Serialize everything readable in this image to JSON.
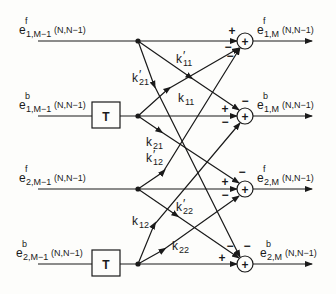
{
  "diagram": {
    "type": "two-channel lattice filter stage (signal flow graph)",
    "inputs": [
      {
        "id": "in_f1",
        "base": "e",
        "sup": "f",
        "sub": "1,M−1",
        "arg": "(N,N−1)"
      },
      {
        "id": "in_b1",
        "base": "e",
        "sup": "b",
        "sub": "1,M−1",
        "arg": "(N,N−1)"
      },
      {
        "id": "in_f2",
        "base": "e",
        "sup": "f",
        "sub": "2,M−1",
        "arg": "(N,N−1)"
      },
      {
        "id": "in_b2",
        "base": "e",
        "sup": "b",
        "sub": "2,M−1",
        "arg": "(N,N−1)"
      }
    ],
    "outputs": [
      {
        "id": "out_f1",
        "base": "e",
        "sup": "f",
        "sub": "1,M",
        "arg": "(N,N−1)"
      },
      {
        "id": "out_b1",
        "base": "e",
        "sup": "b",
        "sub": "1,M",
        "arg": "(N,N−1)"
      },
      {
        "id": "out_f2",
        "base": "e",
        "sup": "f",
        "sub": "2,M",
        "arg": "(N,N−1)"
      },
      {
        "id": "out_b2",
        "base": "e",
        "sup": "b",
        "sub": "2,M",
        "arg": "(N,N−1)"
      }
    ],
    "delays": [
      {
        "id": "delay1",
        "label": "T"
      },
      {
        "id": "delay2",
        "label": "T"
      }
    ],
    "summers": [
      {
        "id": "sum1",
        "symbol": "+",
        "signs": [
          "+",
          "−",
          "−"
        ]
      },
      {
        "id": "sum2",
        "symbol": "+",
        "signs": [
          "−",
          "+",
          "−"
        ]
      },
      {
        "id": "sum3",
        "symbol": "+",
        "signs": [
          "−",
          "+",
          "−"
        ]
      },
      {
        "id": "sum4",
        "symbol": "+",
        "signs": [
          "−",
          "−",
          "+"
        ]
      }
    ],
    "coefficients": [
      {
        "id": "k11p",
        "base": "k",
        "prime": "′",
        "sub": "11"
      },
      {
        "id": "k21p",
        "base": "k",
        "prime": "′",
        "sub": "21"
      },
      {
        "id": "k11",
        "base": "k",
        "prime": "",
        "sub": "11"
      },
      {
        "id": "k21",
        "base": "k",
        "prime": "",
        "sub": "21"
      },
      {
        "id": "k12p",
        "base": "k",
        "prime": "′",
        "sub": "12"
      },
      {
        "id": "k12",
        "base": "k",
        "prime": "",
        "sub": "12"
      },
      {
        "id": "k22p",
        "base": "k",
        "prime": "′",
        "sub": "22"
      },
      {
        "id": "k22",
        "base": "k",
        "prime": "",
        "sub": "22"
      }
    ],
    "colors": {
      "ink": "#1a1a1a",
      "paper": "#fdfdfb"
    }
  }
}
